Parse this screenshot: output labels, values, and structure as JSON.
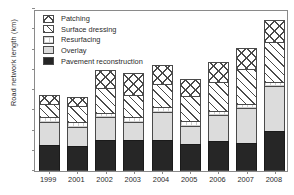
{
  "chart_data": {
    "type": "bar",
    "title": "",
    "subtitle": "",
    "stacked": true,
    "xlabel": "",
    "ylabel": "Road network length (km)",
    "categories": [
      "1999",
      "2001",
      "2002",
      "2003",
      "2004",
      "2005",
      "2006",
      "2007",
      "2008"
    ],
    "ylim": [
      0,
      180
    ],
    "y_ticks_labeled": false,
    "y_tick_count": 9,
    "grid": false,
    "legend_position": "top-left",
    "series": [
      {
        "name": "Pavement reconstruction",
        "pattern": "solid-black",
        "color": "#262626",
        "values": [
          29,
          28,
          34,
          34,
          34,
          30,
          33,
          31,
          44
        ]
      },
      {
        "name": "Overlay",
        "pattern": "solid-light-gray",
        "color": "#dcdcdc",
        "values": [
          25,
          21,
          26,
          21,
          32,
          20,
          29,
          39,
          50
        ]
      },
      {
        "name": "Resurfacing",
        "pattern": "fine-crosshatch",
        "color": "#ffffff",
        "values": [
          6,
          6,
          5,
          5,
          5,
          6,
          5,
          5,
          5
        ]
      },
      {
        "name": "Surface dressing",
        "pattern": "diagonal-hatch",
        "color": "#ffffff",
        "values": [
          15,
          17,
          27,
          25,
          26,
          27,
          32,
          38,
          44
        ]
      },
      {
        "name": "Patching",
        "pattern": "cross-hatch",
        "color": "#ffffff",
        "values": [
          9,
          10,
          20,
          24,
          21,
          19,
          22,
          24,
          25
        ]
      }
    ],
    "totals": [
      84,
      82,
      112,
      109,
      118,
      102,
      121,
      137,
      168
    ],
    "legend": [
      "Patching",
      "Surface dressing",
      "Resurfacing",
      "Overlay",
      "Pavement reconstruction"
    ]
  }
}
